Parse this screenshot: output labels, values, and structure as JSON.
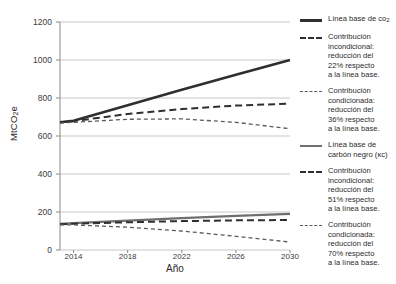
{
  "chart_data": {
    "type": "line",
    "title": "",
    "xlabel": "Año",
    "ylabel": "MtCO₂e",
    "xlim": [
      2013,
      2030
    ],
    "ylim": [
      0,
      1200
    ],
    "grid": true,
    "legend_position": "right",
    "x": [
      2013,
      2014,
      2018,
      2022,
      2026,
      2030
    ],
    "yticks": [
      "0",
      "200",
      "400",
      "600",
      "800",
      "1000",
      "1200"
    ],
    "xticks": [
      "2014",
      "2018",
      "2022",
      "2026",
      "2030"
    ],
    "series": [
      {
        "name": "Línea base de co₂",
        "style": "solid-thick",
        "values": [
          672,
          680,
          762,
          843,
          922,
          1000
        ]
      },
      {
        "name": "Contribución incondicional: reducción del 22% respecto a la línea base.",
        "style": "dash",
        "values": [
          672,
          678,
          716,
          742,
          760,
          770
        ]
      },
      {
        "name": "Contribución condicionada: reducción del 36% respecto a la línea base.",
        "style": "dash-small",
        "values": [
          668,
          672,
          688,
          690,
          672,
          638
        ]
      },
      {
        "name": "Línea base de carbón negro (ᴋᴄ)",
        "style": "solid",
        "values": [
          138,
          141,
          155,
          168,
          180,
          190
        ]
      },
      {
        "name": "Contribución incondicional: reducción del 51% respecto a la línea base.",
        "style": "dash",
        "values": [
          136,
          138,
          146,
          152,
          156,
          158
        ]
      },
      {
        "name": "Contribución condicionada: reducción del 70% respecto a la línea base.",
        "style": "dash-small",
        "values": [
          132,
          132,
          120,
          100,
          72,
          42
        ]
      }
    ]
  },
  "axes": {
    "ylabel_main": "MtCO",
    "ylabel_sub": "2",
    "ylabel_tail": "e",
    "xlabel": "Año",
    "yticks": [
      {
        "label": "1200"
      },
      {
        "label": "1000"
      },
      {
        "label": "800"
      },
      {
        "label": "600"
      },
      {
        "label": "400"
      },
      {
        "label": "200"
      },
      {
        "label": "0"
      }
    ],
    "xticks": [
      {
        "label": "2014"
      },
      {
        "label": "2018"
      },
      {
        "label": "2022"
      },
      {
        "label": "2026"
      },
      {
        "label": "2030"
      }
    ]
  },
  "legend": {
    "items": [
      {
        "style": "solid-thick",
        "text_main": "Línea base de co",
        "text_sub": "2",
        "text_tail": ""
      },
      {
        "style": "dash",
        "text_main": "Contribución\nincondicional:\nreducción del\n22% respecto\na la línea base.",
        "text_sub": "",
        "text_tail": ""
      },
      {
        "style": "dash-small",
        "text_main": "Contribución\ncondicionada:\nreducción del\n36% respecto\na la línea base.",
        "text_sub": "",
        "text_tail": ""
      },
      {
        "style": "solid",
        "text_main": "Línea base de\ncarbón negro (ᴋᴄ)",
        "text_sub": "",
        "text_tail": ""
      },
      {
        "style": "dash",
        "text_main": "Contribución\nincondicional:\nreducción del\n51% respecto\na la línea base.",
        "text_sub": "",
        "text_tail": ""
      },
      {
        "style": "dash-small",
        "text_main": "Contribución\ncondicionada:\nreducción del\n70% respecto\na la línea base.",
        "text_sub": "",
        "text_tail": ""
      }
    ]
  },
  "colors": {
    "baseline_co2": "#2f2f2f",
    "baseline_bc": "#6f6f6f",
    "grid": "#b9b9b9",
    "axis": "#8a8a8a",
    "text": "#2b2b2b"
  }
}
